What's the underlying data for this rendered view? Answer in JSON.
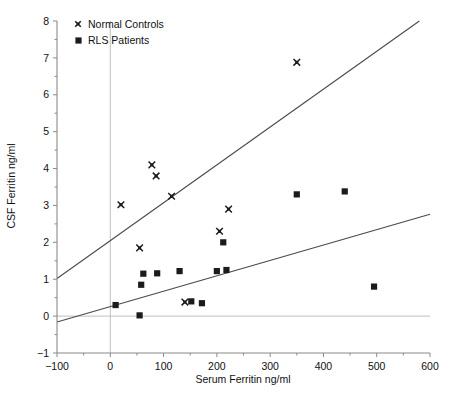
{
  "chart_data": {
    "type": "scatter",
    "title": "",
    "xlabel": "Serum Ferritin ng/ml",
    "ylabel": "CSF Ferritin ng/ml",
    "xlim": [
      -100,
      600
    ],
    "ylim": [
      -1,
      8
    ],
    "xticks": [
      -100,
      0,
      100,
      200,
      300,
      400,
      500,
      600
    ],
    "xtick_labels": [
      "-100",
      "0",
      "100",
      "200",
      "300",
      "400",
      "500",
      "600"
    ],
    "yticks": [
      -1,
      0,
      1,
      2,
      3,
      4,
      5,
      6,
      7,
      8
    ],
    "ytick_labels": [
      "-1",
      "0",
      "1",
      "2",
      "3",
      "4",
      "5",
      "6",
      "7",
      "8"
    ],
    "grid": false,
    "legend_position": "top-left",
    "reference_lines": [
      {
        "name": "y-zero-line",
        "orientation": "horizontal",
        "value": 0,
        "color": "#b9b9b9"
      },
      {
        "name": "x-zero-line",
        "orientation": "vertical",
        "value": 0,
        "color": "#b9b9b9"
      }
    ],
    "series": [
      {
        "name": "Normal Controls",
        "marker": "cross",
        "color": "#1b1b1b",
        "points": [
          [
            20,
            3.02
          ],
          [
            55,
            1.85
          ],
          [
            78,
            4.1
          ],
          [
            86,
            3.8
          ],
          [
            115,
            3.25
          ],
          [
            140,
            0.38
          ],
          [
            205,
            2.3
          ],
          [
            222,
            2.9
          ],
          [
            350,
            6.88
          ]
        ],
        "fit_line": {
          "name": "normal-controls-regression",
          "x_start": -100,
          "y_start": 1.02,
          "x_end": 580,
          "y_end": 8.0
        }
      },
      {
        "name": "RLS Patients",
        "marker": "square",
        "color": "#1b1b1b",
        "points": [
          [
            10,
            0.3
          ],
          [
            55,
            0.02
          ],
          [
            58,
            0.85
          ],
          [
            62,
            1.15
          ],
          [
            88,
            1.16
          ],
          [
            130,
            1.22
          ],
          [
            152,
            0.4
          ],
          [
            172,
            0.35
          ],
          [
            200,
            1.22
          ],
          [
            212,
            2.0
          ],
          [
            218,
            1.25
          ],
          [
            350,
            3.3
          ],
          [
            440,
            3.38
          ],
          [
            495,
            0.8
          ]
        ],
        "fit_line": {
          "name": "rls-patients-regression",
          "x_start": -100,
          "y_start": -0.16,
          "x_end": 600,
          "y_end": 2.76
        }
      }
    ]
  },
  "legend": {
    "entries": [
      {
        "label": "Normal Controls",
        "marker": "cross"
      },
      {
        "label": "RLS Patients",
        "marker": "square"
      }
    ]
  }
}
